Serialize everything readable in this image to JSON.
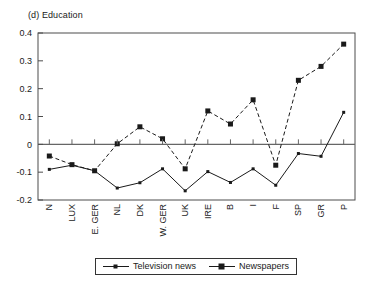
{
  "chart_data": {
    "type": "line",
    "title": "(d) Education",
    "xlabel": "",
    "ylabel": "",
    "ylim": [
      -0.2,
      0.4
    ],
    "ytick_labels": [
      "0.4",
      "0.3",
      "0.2",
      "0.1",
      "0",
      "-0.1",
      "-0.2"
    ],
    "yticks": [
      0.4,
      0.3,
      0.2,
      0.1,
      0,
      -0.1,
      -0.2
    ],
    "grid": false,
    "legend_position": "bottom-center",
    "categories": [
      "N",
      "LUX",
      "E. GER",
      "NL",
      "DK",
      "W. GER",
      "UK",
      "IRE",
      "B",
      "I",
      "F",
      "SP",
      "GR",
      "P"
    ],
    "series": [
      {
        "name": "Television news",
        "style": "solid",
        "marker": "small-square",
        "values": [
          -0.09,
          -0.075,
          -0.095,
          -0.157,
          -0.138,
          -0.088,
          -0.167,
          -0.098,
          -0.137,
          -0.088,
          -0.147,
          -0.033,
          -0.043,
          0.115
        ]
      },
      {
        "name": "Newspapers",
        "style": "dashed",
        "marker": "square",
        "values": [
          -0.042,
          -0.073,
          -0.095,
          0.002,
          0.063,
          0.02,
          -0.088,
          0.12,
          0.073,
          0.16,
          -0.075,
          0.23,
          0.28,
          0.36
        ]
      }
    ]
  },
  "legend": {
    "items": [
      {
        "label": "Television news"
      },
      {
        "label": "Newspapers"
      }
    ]
  },
  "colors": {
    "line": "#1a1a1a",
    "axis": "#4d4d4d",
    "background": "#ffffff"
  }
}
